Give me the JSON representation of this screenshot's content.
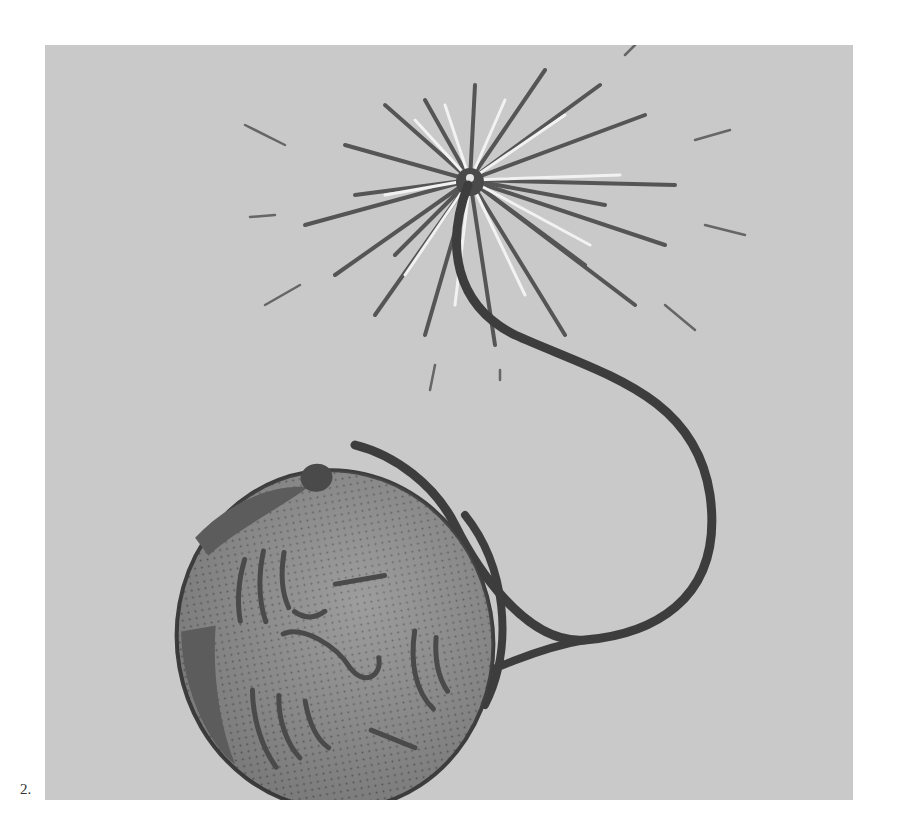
{
  "figure": {
    "caption": "2.",
    "colors": {
      "background": "#c9c9c9",
      "bomb_fill": "#8a8a8a",
      "bomb_shadow": "#5c5c5c",
      "line": "#3d3d3d",
      "spark_light": "#f2f2f2",
      "spark_dark": "#555555"
    }
  }
}
